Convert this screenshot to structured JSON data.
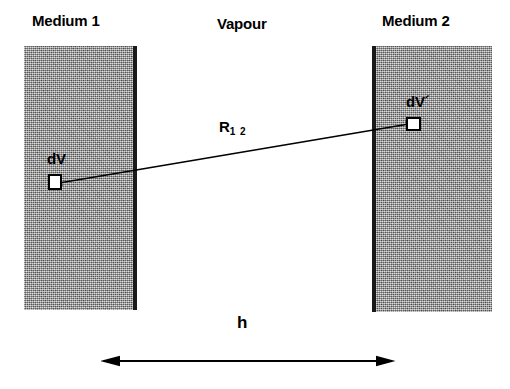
{
  "figure": {
    "type": "physics-schematic",
    "background_color": "#ffffff",
    "ink_color": "#000000",
    "medium_fill_color": "#9a9a9a",
    "medium_edge_color": "#1a1a1a"
  },
  "labels": {
    "medium_1": "Medium 1",
    "vapour": "Vapour",
    "medium_2": "Medium 2",
    "dv": "dV",
    "dv_prime": "dV´",
    "distance_symbol": "R",
    "distance_subscript": "1 2",
    "gap": "h"
  },
  "blocks": [
    {
      "name": "medium-1",
      "label": "Medium 1",
      "x": 24,
      "y": 46,
      "width": 113,
      "height": 264,
      "interface_side": "right"
    },
    {
      "name": "medium-2",
      "label": "Medium 2",
      "x": 372,
      "y": 46,
      "width": 120,
      "height": 266,
      "interface_side": "left"
    }
  ],
  "volume_elements": [
    {
      "name": "dV",
      "label": "dV",
      "x": 48,
      "y": 174,
      "width": 14,
      "height": 16,
      "in_medium": "Medium 1"
    },
    {
      "name": "dV'",
      "label": "dV´",
      "x": 406,
      "y": 117,
      "width": 15,
      "height": 14,
      "in_medium": "Medium 2"
    }
  ],
  "arrows": [
    {
      "name": "separation-vector",
      "label": "R12",
      "style": "double-headed",
      "from": {
        "x": 62,
        "y": 182
      },
      "to": {
        "x": 406,
        "y": 124
      }
    },
    {
      "name": "gap-width",
      "label": "h",
      "style": "double-headed",
      "from": {
        "x": 120,
        "y": 361
      },
      "to": {
        "x": 376,
        "y": 361
      }
    }
  ]
}
